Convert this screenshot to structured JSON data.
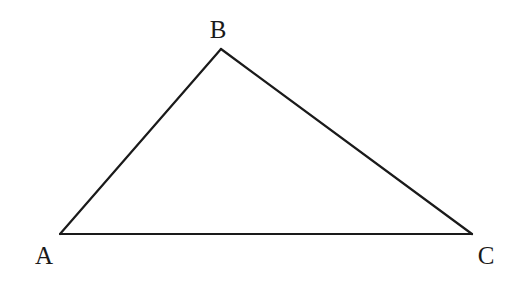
{
  "diagram": {
    "type": "triangle",
    "stroke_color": "#1a1a1a",
    "background": "#ffffff",
    "vertices": [
      {
        "label": "A",
        "x": 60,
        "y": 234,
        "label_x": 44,
        "label_y": 264
      },
      {
        "label": "B",
        "x": 221,
        "y": 49,
        "label_x": 218,
        "label_y": 38
      },
      {
        "label": "C",
        "x": 472,
        "y": 234,
        "label_x": 486,
        "label_y": 264
      }
    ],
    "edges": [
      {
        "name": "AB",
        "from": "A",
        "to": "B"
      },
      {
        "name": "BC",
        "from": "B",
        "to": "C"
      },
      {
        "name": "CA",
        "from": "C",
        "to": "A"
      }
    ]
  }
}
